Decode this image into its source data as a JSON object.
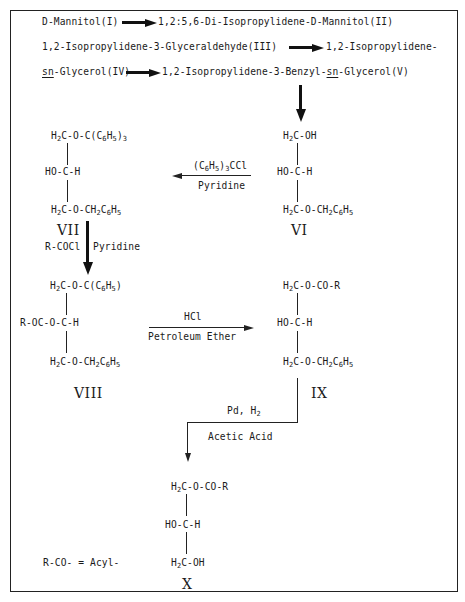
{
  "scheme": {
    "line1": {
      "start": "D-Mannitol(I)",
      "end": "1,2:5,6-Di-Isopropylidene-D-Mannitol(II)"
    },
    "line2": {
      "start": "1,2-Isopropylidene-3-Glyceraldehyde(III)",
      "end": "1,2-Isopropylidene-"
    },
    "line3": {
      "start_prefix": "sn",
      "start_rest": "-Glycerol(IV)",
      "end_part1": "1,2-Isopropylidene-3-Benzyl-",
      "end_prefix": "sn",
      "end_rest": "-Glycerol(V)"
    }
  },
  "compounds": {
    "VI": {
      "label": "VI",
      "top": "H2C-OH",
      "middle": "HO-C-H",
      "bottom_a": "H",
      "bottom_b": "C-O-CH",
      "bottom_c": "C",
      "bottom_d": "H"
    },
    "VII": {
      "label": "VII",
      "top_a": "H",
      "top_b": "C-O-C(C",
      "top_c": "H",
      "top_d": ")",
      "top_sub3": "3",
      "middle": "HO-C-H"
    },
    "VIII": {
      "label": "VIII",
      "top_a": "H",
      "top_b": "C-O-C(C",
      "top_c": "H",
      "top_d": ")",
      "middle": "R-OC-O-C-H"
    },
    "IX": {
      "label": "IX",
      "top_a": "H",
      "top_b": "C-O-CO-R",
      "middle": "HO-C-H"
    },
    "X": {
      "label": "X",
      "top_a": "H",
      "top_b": "C-O-CO-R",
      "middle": "HO-C-H",
      "bottom_a": "H",
      "bottom_b": "C-OH"
    },
    "benzyl_tail": {
      "a": "H",
      "b": "C-O-CH",
      "c": "C",
      "d": "H"
    },
    "subs": {
      "two": "2",
      "six": "6",
      "five": "5",
      "three": "3"
    }
  },
  "reagents": {
    "VI_to_VII": {
      "above_a": "(C",
      "above_b": "H",
      "above_c": ")",
      "above_d": "CCl",
      "below": "Pyridine"
    },
    "VII_to_VIII": {
      "left": "R-COCl",
      "right": "Pyridine"
    },
    "VIII_to_IX": {
      "above": "HCl",
      "below": "Petroleum Ether"
    },
    "IX_to_X": {
      "above_a": "Pd, H",
      "below": "Acetic Acid"
    }
  },
  "legend": {
    "text": "R-CO- = Acyl-"
  }
}
